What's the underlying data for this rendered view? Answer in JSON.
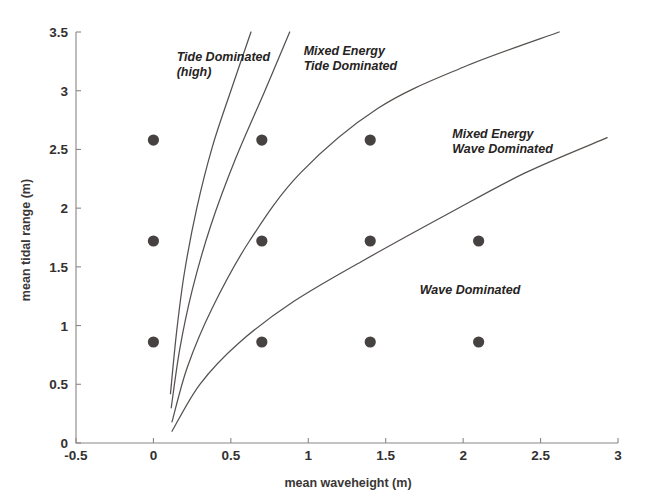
{
  "chart_data": {
    "type": "scatter",
    "title": "",
    "xlabel": "mean waveheight (m)",
    "ylabel": "mean tidal range (m)",
    "xlim": [
      -0.5,
      3
    ],
    "ylim": [
      0,
      3.5
    ],
    "grid": false,
    "legend_position": "none",
    "x_ticks": [
      "-0.5",
      "0",
      "0.5",
      "1",
      "1.5",
      "2",
      "2.5",
      "3"
    ],
    "x_tick_values": [
      -0.5,
      0,
      0.5,
      1,
      1.5,
      2,
      2.5,
      3
    ],
    "y_ticks": [
      "0",
      "0.5",
      "1",
      "1.5",
      "2",
      "2.5",
      "3",
      "3.5"
    ],
    "y_tick_values": [
      0,
      0.5,
      1,
      1.5,
      2,
      2.5,
      3,
      3.5
    ],
    "series": [
      {
        "name": "sample sites",
        "marker": "filled-circle",
        "color": "#464241",
        "points": [
          {
            "x": 0.0,
            "y": 2.58
          },
          {
            "x": 0.7,
            "y": 2.58
          },
          {
            "x": 1.4,
            "y": 2.58
          },
          {
            "x": 0.0,
            "y": 1.72
          },
          {
            "x": 0.7,
            "y": 1.72
          },
          {
            "x": 1.4,
            "y": 1.72
          },
          {
            "x": 2.1,
            "y": 1.72
          },
          {
            "x": 0.0,
            "y": 0.86
          },
          {
            "x": 0.7,
            "y": 0.86
          },
          {
            "x": 1.4,
            "y": 0.86
          },
          {
            "x": 2.1,
            "y": 0.86
          }
        ]
      }
    ],
    "boundary_curves": [
      {
        "name": "tide-dominated-boundary",
        "points": [
          [
            0.11,
            0.42
          ],
          [
            0.15,
            0.95
          ],
          [
            0.2,
            1.45
          ],
          [
            0.28,
            2.0
          ],
          [
            0.38,
            2.52
          ],
          [
            0.5,
            3.0
          ],
          [
            0.63,
            3.5
          ]
        ]
      },
      {
        "name": "mixed-energy-tide-inner-boundary",
        "points": [
          [
            0.115,
            0.3
          ],
          [
            0.17,
            0.8
          ],
          [
            0.25,
            1.3
          ],
          [
            0.37,
            1.85
          ],
          [
            0.53,
            2.42
          ],
          [
            0.72,
            3.0
          ],
          [
            0.88,
            3.5
          ]
        ]
      },
      {
        "name": "mixed-energy-tide-outer-boundary",
        "points": [
          [
            0.12,
            0.18
          ],
          [
            0.22,
            0.65
          ],
          [
            0.38,
            1.15
          ],
          [
            0.62,
            1.72
          ],
          [
            0.95,
            2.3
          ],
          [
            1.45,
            2.85
          ],
          [
            2.0,
            3.2
          ],
          [
            2.62,
            3.5
          ]
        ]
      },
      {
        "name": "wave-dominated-boundary",
        "points": [
          [
            0.12,
            0.1
          ],
          [
            0.3,
            0.5
          ],
          [
            0.55,
            0.85
          ],
          [
            0.9,
            1.2
          ],
          [
            1.35,
            1.55
          ],
          [
            1.9,
            1.95
          ],
          [
            2.4,
            2.3
          ],
          [
            2.93,
            2.6
          ]
        ]
      }
    ],
    "annotations": [
      {
        "id": "tide-dominated",
        "text_lines": [
          "Tide Dominated",
          "(high)"
        ],
        "x": 0.15,
        "y": 3.25
      },
      {
        "id": "mixed-energy-tide-dominated",
        "text_lines": [
          "Mixed Energy",
          "Tide Dominated"
        ],
        "x": 0.97,
        "y": 3.3
      },
      {
        "id": "mixed-energy-wave-dominated",
        "text_lines": [
          "Mixed Energy",
          "Wave Dominated"
        ],
        "x": 1.93,
        "y": 2.6
      },
      {
        "id": "wave-dominated",
        "text_lines": [
          "Wave Dominated"
        ],
        "x": 1.72,
        "y": 1.27
      }
    ],
    "colors": {
      "marker": "#464241",
      "curve": "#55514f",
      "axis": "#8a8785",
      "text": "#2b2b2b",
      "background": "#ffffff"
    }
  }
}
